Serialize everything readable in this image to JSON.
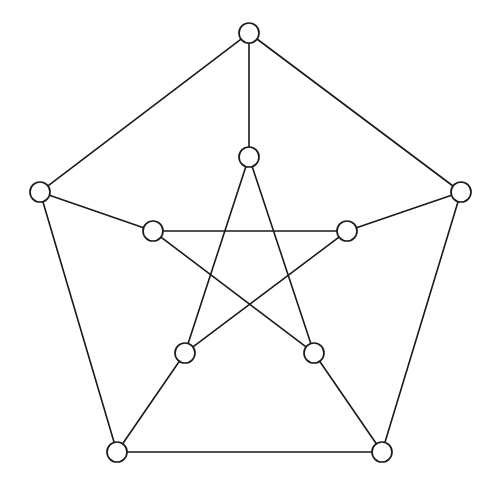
{
  "figure": {
    "type": "graph-diagram",
    "background_color": "#ffffff",
    "stroke_color": "#1a1a1a",
    "vertex_fill_color": "#ffffff",
    "edge_width": 1.6,
    "vertex_radius": 10,
    "vertex_stroke_width": 1.7,
    "width": 499,
    "height": 491,
    "vertex_count": 10,
    "edge_count": 15
  },
  "graph_data": {
    "type": "graph",
    "layout": "pentagon-pentagram",
    "vertices": [
      {
        "id": "o0",
        "name": "outer-top",
        "ring": "outer",
        "index": 0,
        "x": 249,
        "y": 33,
        "degree": 3
      },
      {
        "id": "o1",
        "name": "outer-right",
        "ring": "outer",
        "index": 1,
        "x": 461,
        "y": 192,
        "degree": 3
      },
      {
        "id": "o2",
        "name": "outer-bottom-right",
        "ring": "outer",
        "index": 2,
        "x": 382,
        "y": 452,
        "degree": 3
      },
      {
        "id": "o3",
        "name": "outer-bottom-left",
        "ring": "outer",
        "index": 3,
        "x": 117,
        "y": 452,
        "degree": 3
      },
      {
        "id": "o4",
        "name": "outer-left",
        "ring": "outer",
        "index": 4,
        "x": 40,
        "y": 192,
        "degree": 3
      },
      {
        "id": "i0",
        "name": "inner-top",
        "ring": "inner",
        "index": 0,
        "x": 249,
        "y": 157,
        "degree": 3
      },
      {
        "id": "i1",
        "name": "inner-right",
        "ring": "inner",
        "index": 1,
        "x": 347,
        "y": 231,
        "degree": 3
      },
      {
        "id": "i2",
        "name": "inner-bottom-right",
        "ring": "inner",
        "index": 2,
        "x": 314,
        "y": 353,
        "degree": 3
      },
      {
        "id": "i3",
        "name": "inner-bottom-left",
        "ring": "inner",
        "index": 3,
        "x": 185,
        "y": 353,
        "degree": 3
      },
      {
        "id": "i4",
        "name": "inner-left",
        "ring": "inner",
        "index": 4,
        "x": 153,
        "y": 231,
        "degree": 3
      }
    ],
    "edges": [
      {
        "from": "o0",
        "to": "o1",
        "group": "outer-cycle"
      },
      {
        "from": "o1",
        "to": "o2",
        "group": "outer-cycle"
      },
      {
        "from": "o2",
        "to": "o3",
        "group": "outer-cycle"
      },
      {
        "from": "o3",
        "to": "o4",
        "group": "outer-cycle"
      },
      {
        "from": "o4",
        "to": "o0",
        "group": "outer-cycle"
      },
      {
        "from": "o0",
        "to": "i0",
        "group": "spoke"
      },
      {
        "from": "o1",
        "to": "i1",
        "group": "spoke"
      },
      {
        "from": "o2",
        "to": "i2",
        "group": "spoke"
      },
      {
        "from": "o3",
        "to": "i3",
        "group": "spoke"
      },
      {
        "from": "o4",
        "to": "i4",
        "group": "spoke"
      },
      {
        "from": "i0",
        "to": "i2",
        "group": "inner-pentagram"
      },
      {
        "from": "i2",
        "to": "i4",
        "group": "inner-pentagram"
      },
      {
        "from": "i4",
        "to": "i1",
        "group": "inner-pentagram"
      },
      {
        "from": "i1",
        "to": "i3",
        "group": "inner-pentagram"
      },
      {
        "from": "i3",
        "to": "i0",
        "group": "inner-pentagram"
      }
    ]
  }
}
